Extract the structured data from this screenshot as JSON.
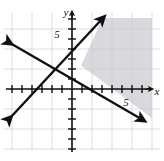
{
  "figure": {
    "background_color": "#ffffff"
  },
  "axes": {
    "x_axis_label": "x",
    "y_axis_label": "y",
    "axis_color": "#101010",
    "grid_color": "#c8c8cf",
    "origin_px": {
      "x": 72,
      "y": 89
    },
    "unit_px": 10,
    "x_range": [
      -7,
      8
    ],
    "y_range": [
      -7,
      7
    ],
    "tick_labels": [
      {
        "name": "y-tick-5",
        "text": "5",
        "axis": "y",
        "value": 5
      },
      {
        "name": "x-tick-5",
        "text": "5",
        "axis": "x",
        "value": 5
      }
    ]
  },
  "chart_data": {
    "type": "line",
    "xlabel": "x",
    "ylabel": "y",
    "xlim": [
      -7,
      8
    ],
    "ylim": [
      -7,
      7
    ],
    "grid": true,
    "legend": "none",
    "series": [
      {
        "name": "rising-boundary-line",
        "style": "solid",
        "slope": 1.3,
        "intercept": 1.2,
        "arrow_both_ends": true,
        "points": [
          {
            "x": -6.2,
            "y": -2.9
          },
          {
            "x": 3.1,
            "y": 7.1
          }
        ]
      },
      {
        "name": "falling-boundary-line",
        "style": "solid",
        "slope": -0.58,
        "intercept": 1.75,
        "arrow_both_ends": true,
        "points": [
          {
            "x": -6.2,
            "y": 4.6
          },
          {
            "x": 7.1,
            "y": -3.1
          }
        ]
      }
    ],
    "shaded_region": {
      "name": "solution-region",
      "fill_color": "#d9d9dd",
      "description": "Region above the falling line and to the right of the rising line, extending into the upper-right quadrant",
      "vertices": [
        {
          "x": 0.9,
          "y": 2.35
        },
        {
          "x": 3.1,
          "y": 7.1
        },
        {
          "x": 8.0,
          "y": 7.1
        },
        {
          "x": 8.0,
          "y": -2.9
        }
      ]
    }
  }
}
